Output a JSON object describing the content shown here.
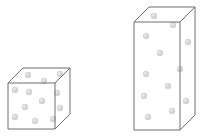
{
  "diagram": {
    "colors": {
      "edge": "#6e6e6e",
      "particle": "#d4d4d4",
      "particle_highlight": "#e8e8e8",
      "background": "#ffffff"
    },
    "shapes": [
      {
        "name": "cube",
        "front": {
          "x": 8,
          "y": 83,
          "w": 47,
          "h": 46
        },
        "depth": {
          "dx": 15,
          "dy": -15
        },
        "particles": [
          [
            28,
            75
          ],
          [
            60,
            74
          ],
          [
            44,
            81
          ],
          [
            15,
            90
          ],
          [
            29,
            92
          ],
          [
            57,
            93
          ],
          [
            42,
            101
          ],
          [
            25,
            107
          ],
          [
            60,
            108
          ],
          [
            15,
            117
          ],
          [
            35,
            121
          ],
          [
            53,
            119
          ]
        ]
      },
      {
        "name": "tall-box",
        "front": {
          "x": 134,
          "y": 22,
          "w": 46,
          "h": 108
        },
        "depth": {
          "dx": 15,
          "dy": -15
        },
        "particles": [
          [
            154,
            16
          ],
          [
            173,
            25
          ],
          [
            146,
            36
          ],
          [
            188,
            42
          ],
          [
            160,
            53
          ],
          [
            180,
            69
          ],
          [
            146,
            74
          ],
          [
            168,
            86
          ],
          [
            144,
            96
          ],
          [
            186,
            101
          ],
          [
            172,
            111
          ],
          [
            148,
            117
          ]
        ]
      }
    ]
  }
}
